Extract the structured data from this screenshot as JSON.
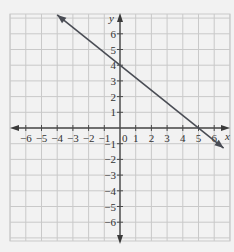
{
  "chart_data": {
    "type": "line",
    "title": "",
    "xlabel": "x",
    "ylabel": "y",
    "xlim": [
      -7,
      7
    ],
    "ylim": [
      -7,
      7
    ],
    "grid": true,
    "origin_label": "0",
    "x_ticks": [
      -6,
      -5,
      -4,
      -3,
      -2,
      -1,
      1,
      2,
      3,
      4,
      5,
      6
    ],
    "y_ticks": [
      6,
      5,
      4,
      3,
      2,
      1,
      -1,
      -2,
      -3,
      -4,
      -5,
      -6
    ],
    "x_tick_labels": [
      "−6",
      "−5",
      "−4",
      "−3",
      "−2",
      "−1",
      "1",
      "2",
      "3",
      "4",
      "5",
      "6"
    ],
    "y_tick_labels": [
      "6",
      "5",
      "4",
      "3",
      "2",
      "1",
      "−1",
      "−2",
      "−3",
      "−4",
      "−5",
      "−6"
    ],
    "series": [
      {
        "name": "line",
        "equation": "y = -4/5 x + 4",
        "points": [
          [
            -4,
            7.2
          ],
          [
            6.6,
            -1.28
          ]
        ],
        "intercepts": {
          "x": 5,
          "y": 4
        },
        "arrows": "both",
        "color": "#4a4d55"
      }
    ]
  }
}
